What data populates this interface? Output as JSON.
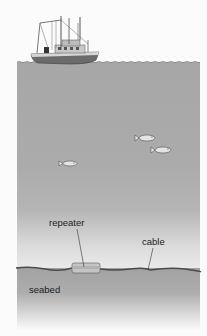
{
  "diagram": {
    "labels": {
      "repeater": "repeater",
      "cable": "cable",
      "seabed": "seabed"
    },
    "elements": [
      "fishing-boat",
      "sea-surface",
      "fish",
      "repeater",
      "cable",
      "seabed"
    ],
    "colors": {
      "background": "#fbfbfb",
      "water": "#a9a9a9",
      "seabed": "#a2a2a2",
      "cable": "#4a4a4a",
      "label": "#1c1c1c"
    }
  }
}
